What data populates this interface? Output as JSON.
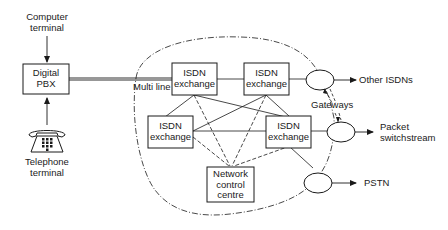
{
  "diagram": {
    "type": "network-architecture",
    "colors": {
      "ink": "#1a1a1a",
      "background": "#ffffff"
    },
    "nodes": {
      "computer_terminal": {
        "label_line1": "Computer",
        "label_line2": "terminal"
      },
      "digital_pbx": {
        "label_line1": "Digital",
        "label_line2": "PBX"
      },
      "telephone_terminal": {
        "label_line1": "Telephone",
        "label_line2": "terminal",
        "icon": "telephone-icon"
      },
      "isdn_exchange_1": {
        "label_line1": "ISDN",
        "label_line2": "exchange"
      },
      "isdn_exchange_2": {
        "label_line1": "ISDN",
        "label_line2": "exchange"
      },
      "isdn_exchange_3": {
        "label_line1": "ISDN",
        "label_line2": "exchange"
      },
      "isdn_exchange_4": {
        "label_line1": "ISDN",
        "label_line2": "exchange"
      },
      "network_control_centre": {
        "label_line1": "Network",
        "label_line2": "control",
        "label_line3": "centre"
      },
      "gateway_1": {
        "shape": "ellipse"
      },
      "gateway_2": {
        "shape": "ellipse"
      },
      "gateway_3": {
        "shape": "ellipse"
      }
    },
    "labels": {
      "multi_line": "Multi line",
      "gateways": "Gateways",
      "other_isdns": "Other ISDNs",
      "packet_switchstream_line1": "Packet",
      "packet_switchstream_line2": "switchstream",
      "pstn": "PSTN"
    },
    "edges": [
      {
        "from": "computer_terminal",
        "to": "digital_pbx",
        "style": "arrow"
      },
      {
        "from": "telephone_terminal",
        "to": "digital_pbx",
        "style": "arrow"
      },
      {
        "from": "digital_pbx",
        "to": "isdn_exchange_1",
        "style": "double-line",
        "label": "Multi line"
      },
      {
        "from": "isdn_exchange_1",
        "to": "isdn_exchange_2",
        "style": "solid"
      },
      {
        "from": "isdn_exchange_1",
        "to": "isdn_exchange_3",
        "style": "solid"
      },
      {
        "from": "isdn_exchange_1",
        "to": "isdn_exchange_4",
        "style": "solid"
      },
      {
        "from": "isdn_exchange_2",
        "to": "isdn_exchange_3",
        "style": "solid"
      },
      {
        "from": "isdn_exchange_2",
        "to": "isdn_exchange_4",
        "style": "solid"
      },
      {
        "from": "isdn_exchange_3",
        "to": "isdn_exchange_4",
        "style": "solid"
      },
      {
        "from": "isdn_exchange_1",
        "to": "network_control_centre",
        "style": "dashed"
      },
      {
        "from": "isdn_exchange_2",
        "to": "network_control_centre",
        "style": "dashed"
      },
      {
        "from": "isdn_exchange_3",
        "to": "network_control_centre",
        "style": "dashed"
      },
      {
        "from": "isdn_exchange_4",
        "to": "network_control_centre",
        "style": "dashed"
      },
      {
        "from": "isdn_exchange_2",
        "to": "gateway_1",
        "style": "solid"
      },
      {
        "from": "isdn_exchange_4",
        "to": "gateway_2",
        "style": "solid"
      },
      {
        "from": "isdn_exchange_4",
        "to": "gateway_3",
        "style": "solid"
      },
      {
        "from": "gateway_1",
        "to": "Other ISDNs",
        "style": "arrow"
      },
      {
        "from": "gateway_2",
        "to": "Packet switchstream",
        "style": "arrow"
      },
      {
        "from": "gateway_3",
        "to": "PSTN",
        "style": "arrow"
      }
    ],
    "boundary": {
      "style": "dash-dot",
      "shape": "closed-curve",
      "encloses": "ISDN network"
    }
  }
}
